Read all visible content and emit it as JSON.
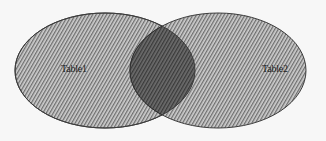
{
  "diagram": {
    "type": "venn",
    "sets": [
      {
        "id": "table1",
        "label": "Table1",
        "ellipse": {
          "cx": 105,
          "cy": 70.5,
          "rx": 90,
          "ry": 57.5
        },
        "label_pos": {
          "x": 61,
          "y": 64
        }
      },
      {
        "id": "table2",
        "label": "Table2",
        "ellipse": {
          "cx": 218,
          "cy": 70.5,
          "rx": 88,
          "ry": 57.5
        },
        "label_pos": {
          "x": 262,
          "y": 64
        }
      }
    ],
    "intersection": {
      "label": ""
    },
    "colors": {
      "background": "#f7f7f7",
      "fill": "#c8c8c8",
      "hatch": "#6a6a6a",
      "intersection_fill": "#5a5a5a",
      "stroke": "#3c3c3c",
      "text": "#222222"
    }
  }
}
